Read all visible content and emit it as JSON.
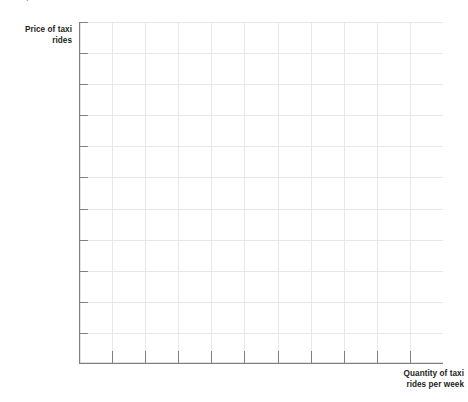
{
  "figure": {
    "background_color": "#ffffff",
    "width": 468,
    "height": 402,
    "top_clipped_caption": "."
  },
  "axes": {
    "y_label_line1": "Price of taxi",
    "y_label_line2": "rides",
    "x_label_line1": "Quantity of taxi",
    "x_label_line2": "rides per week",
    "axis_color": "#808080",
    "grid_color": "#e8e8e8",
    "label_color": "#231f20"
  },
  "chart_data": {
    "type": "line",
    "title": "",
    "subtitle": "",
    "xlabel": "Quantity of taxi rides per week",
    "ylabel": "Price of taxi rides",
    "series": [],
    "categories": [],
    "x": [],
    "values": [],
    "annotations": [],
    "legend": [],
    "legend_position": "none",
    "grid": true,
    "xlim": [
      0,
      11
    ],
    "ylim": [
      0,
      11
    ],
    "x_tick_labels": [],
    "y_tick_labels": [],
    "x_gridline_count": 12,
    "y_gridline_count": 12,
    "note": "Blank graph template: axes with unlabeled tick marks and gridlines, no plotted data."
  }
}
